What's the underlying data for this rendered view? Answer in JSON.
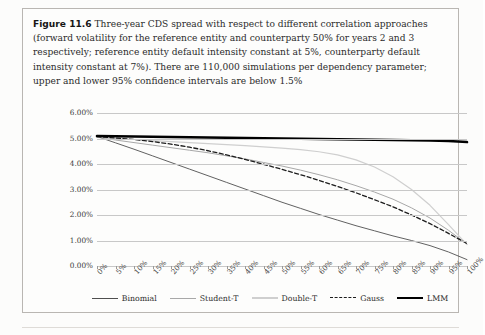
{
  "figure": {
    "label": "Figure 11.6",
    "caption": "Three-year CDS spread with respect to different correlation approaches (forward volatility for the reference entity and counterparty 50% for years 2 and 3 respectively; reference entity default intensity constant at 5%, counterparty default intensity constant at 7%). There are 110,000 simulations per dependency parameter; upper and lower 95% confidence intervals are below 1.5%"
  },
  "chart_data": {
    "type": "line",
    "title": "",
    "subtitle": "",
    "xlabel": "",
    "ylabel": "",
    "grid": true,
    "legend_position": "bottom",
    "xlim": [
      0,
      100
    ],
    "ylim": [
      0,
      6
    ],
    "ytick_labels": [
      "6.00%",
      "5.00%",
      "4.00%",
      "3.00%",
      "2.00%",
      "1.00%",
      "0.00%"
    ],
    "ytick_values": [
      6,
      5,
      4,
      3,
      2,
      1,
      0
    ],
    "categories": [
      "0%",
      "5%",
      "10%",
      "15%",
      "20%",
      "25%",
      "30%",
      "35%",
      "40%",
      "45%",
      "50%",
      "55%",
      "60%",
      "65%",
      "70%",
      "75%",
      "80%",
      "85%",
      "90%",
      "95%",
      "100%"
    ],
    "x": [
      0,
      5,
      10,
      15,
      20,
      25,
      30,
      35,
      40,
      45,
      50,
      55,
      60,
      65,
      70,
      75,
      80,
      85,
      90,
      95,
      100
    ],
    "series": [
      {
        "name": "Binomial",
        "color": "#4f4f4f",
        "width": 0.9,
        "dash": "none",
        "values": [
          5.08,
          4.83,
          4.58,
          4.32,
          4.06,
          3.8,
          3.54,
          3.28,
          3.02,
          2.76,
          2.5,
          2.26,
          2.02,
          1.8,
          1.58,
          1.38,
          1.18,
          1.0,
          0.8,
          0.55,
          0.25
        ]
      },
      {
        "name": "Student-T",
        "color": "#a8a8a8",
        "width": 1.0,
        "dash": "none",
        "values": [
          5.06,
          4.94,
          4.84,
          4.74,
          4.64,
          4.54,
          4.44,
          4.32,
          4.2,
          4.06,
          3.92,
          3.76,
          3.58,
          3.38,
          3.15,
          2.9,
          2.62,
          2.28,
          1.88,
          1.4,
          0.86
        ]
      },
      {
        "name": "Double-T",
        "color": "#cfcfcf",
        "width": 1.2,
        "dash": "none",
        "values": [
          5.04,
          5.0,
          4.96,
          4.92,
          4.88,
          4.84,
          4.8,
          4.76,
          4.72,
          4.67,
          4.62,
          4.56,
          4.48,
          4.36,
          4.16,
          3.88,
          3.5,
          3.0,
          2.38,
          1.62,
          0.84
        ]
      },
      {
        "name": "Gauss",
        "color": "#1d1d1d",
        "width": 1.3,
        "dash": "4,2.5",
        "values": [
          5.07,
          5.02,
          4.96,
          4.88,
          4.78,
          4.66,
          4.52,
          4.36,
          4.18,
          3.99,
          3.79,
          3.58,
          3.36,
          3.12,
          2.87,
          2.6,
          2.32,
          2.0,
          1.66,
          1.28,
          0.88
        ]
      },
      {
        "name": "LMM",
        "color": "#000000",
        "width": 2.6,
        "dash": "none",
        "values": [
          5.1,
          5.09,
          5.08,
          5.07,
          5.06,
          5.05,
          5.04,
          5.03,
          5.02,
          5.01,
          5.0,
          4.99,
          4.98,
          4.97,
          4.96,
          4.95,
          4.94,
          4.93,
          4.92,
          4.9,
          4.86
        ]
      }
    ]
  },
  "legend": {
    "items": [
      {
        "label": "Binomial"
      },
      {
        "label": "Student-T"
      },
      {
        "label": "Double-T"
      },
      {
        "label": "Gauss"
      },
      {
        "label": "LMM"
      }
    ]
  }
}
